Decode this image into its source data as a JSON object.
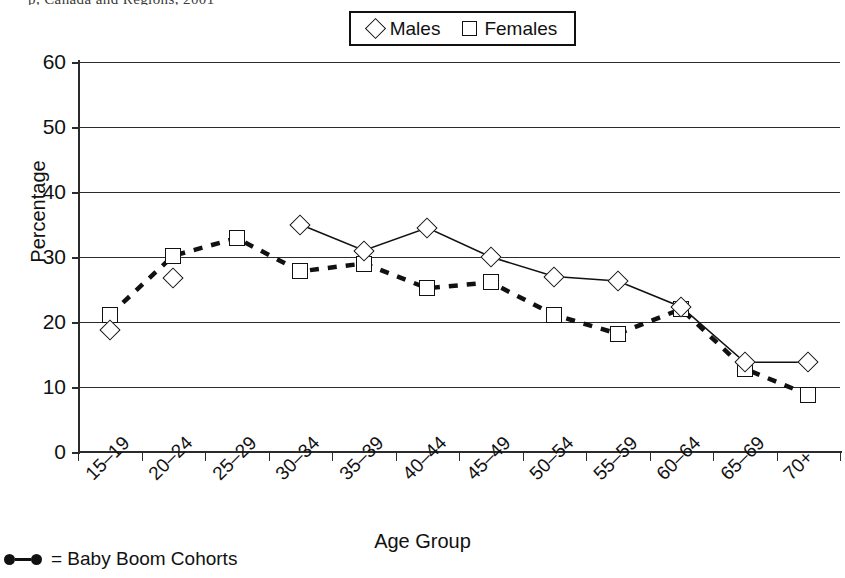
{
  "top_remnant": "p, Canada and Regions, 2001",
  "legend": {
    "position": "top-center",
    "entries": [
      {
        "marker": "diamond-outline-icon",
        "label": "Males"
      },
      {
        "marker": "square-outline-icon",
        "label": "Females"
      }
    ]
  },
  "footnote": {
    "marker": "filled-dot-line-icon",
    "text": "= Baby Boom Cohorts"
  },
  "chart_data": {
    "type": "line",
    "title": "",
    "xlabel": "Age Group",
    "ylabel": "Percentage",
    "ylim": [
      0,
      60
    ],
    "yticks": [
      0,
      10,
      20,
      30,
      40,
      50,
      60
    ],
    "grid": true,
    "legend_position": "top-center",
    "categories": [
      "15–19",
      "20–24",
      "25–29",
      "30–34",
      "35–39",
      "40–44",
      "45–49",
      "50–54",
      "55–59",
      "60–64",
      "65–69",
      "70+"
    ],
    "series": [
      {
        "name": "Males",
        "marker": "diamond",
        "line_style": "solid-thin",
        "values": [
          18.8,
          26.7,
          null,
          35.0,
          31.0,
          34.5,
          30.0,
          27.0,
          26.3,
          22.3,
          13.8,
          13.8
        ]
      },
      {
        "name": "Females",
        "marker": "square",
        "line_style": "dashed-thick",
        "values": [
          21.1,
          30.2,
          32.9,
          27.8,
          29.0,
          25.2,
          26.1,
          21.1,
          18.2,
          22.0,
          12.8,
          8.8
        ]
      }
    ]
  },
  "colors": {
    "ink": "#111111",
    "grid": "#2b2b2b",
    "background": "#ffffff"
  }
}
